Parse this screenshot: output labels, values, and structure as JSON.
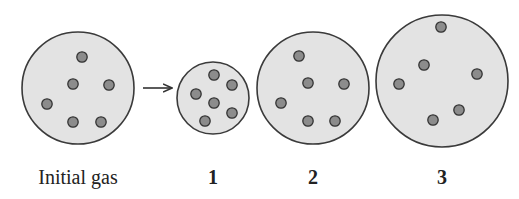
{
  "diagram": {
    "colors": {
      "container_fill": "#e3e3e3",
      "container_stroke": "#3a3a3a",
      "particle_fill": "#8c8c8c",
      "particle_stroke": "#333333",
      "arrow": "#333333"
    },
    "containers": [
      {
        "id": "initial",
        "label": "Initial gas",
        "cx": 78,
        "cy": 88,
        "r": 56,
        "particles": [
          [
            82,
            57
          ],
          [
            73,
            84
          ],
          [
            109,
            85
          ],
          [
            47,
            104
          ],
          [
            73,
            122
          ],
          [
            101,
            122
          ]
        ]
      },
      {
        "id": "1",
        "label": "1",
        "cx": 213,
        "cy": 98,
        "r": 36,
        "particles": [
          [
            214,
            75
          ],
          [
            232,
            85
          ],
          [
            196,
            94
          ],
          [
            214,
            103
          ],
          [
            232,
            113
          ],
          [
            205,
            121
          ]
        ]
      },
      {
        "id": "2",
        "label": "2",
        "cx": 313,
        "cy": 88,
        "r": 56,
        "particles": [
          [
            299,
            56
          ],
          [
            308,
            83
          ],
          [
            344,
            84
          ],
          [
            281,
            103
          ],
          [
            308,
            121
          ],
          [
            335,
            121
          ]
        ]
      },
      {
        "id": "3",
        "label": "3",
        "cx": 442,
        "cy": 81,
        "r": 66,
        "particles": [
          [
            441,
            27
          ],
          [
            424,
            65
          ],
          [
            477,
            74
          ],
          [
            399,
            84
          ],
          [
            459,
            110
          ],
          [
            433,
            120
          ]
        ]
      }
    ],
    "arrow": {
      "from": [
        143,
        88
      ],
      "to": [
        171,
        88
      ]
    },
    "labels": {
      "initial": "Initial gas",
      "c1": "1",
      "c2": "2",
      "c3": "3"
    }
  }
}
